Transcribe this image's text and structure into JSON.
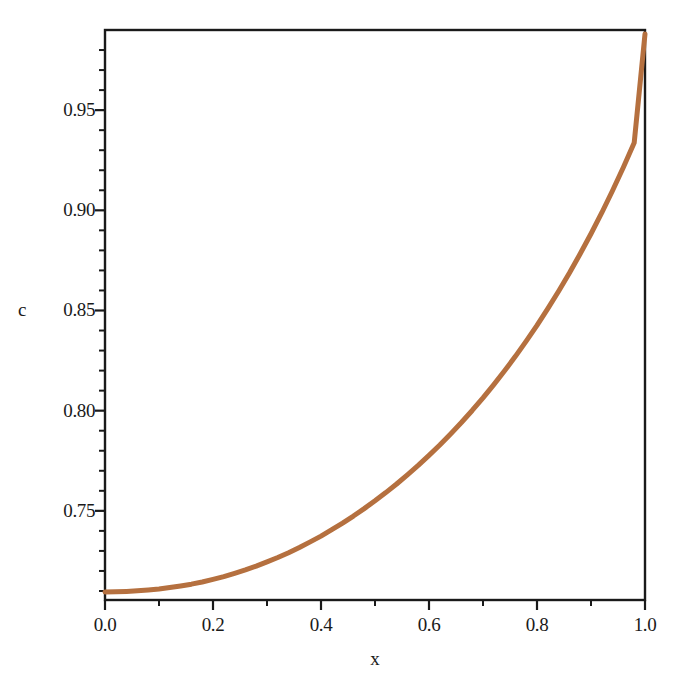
{
  "chart_data": {
    "type": "line",
    "title": "",
    "subtitle": "",
    "xlabel": "x",
    "ylabel": "c",
    "xlim": [
      0.0,
      1.0
    ],
    "ylim": [
      0.7055,
      0.99
    ],
    "grid": false,
    "legend": null,
    "legend_position": "none",
    "line_color": "#b5703f",
    "line_width": 5,
    "axis_color": "#1a1a1a",
    "background": "#ffffff",
    "frame": "full-box",
    "tick_direction": "out",
    "xticks": [
      0.0,
      0.2,
      0.4,
      0.6,
      0.8,
      1.0
    ],
    "xtick_labels": [
      "0.0",
      "0.2",
      "0.4",
      "0.6",
      "0.8",
      "1.0"
    ],
    "x_minor_ticks": [
      0.1,
      0.3,
      0.5,
      0.7,
      0.9
    ],
    "yticks": [
      0.75,
      0.8,
      0.85,
      0.9,
      0.95
    ],
    "ytick_labels": [
      "0.75",
      "0.80",
      "0.85",
      "0.90",
      "0.95"
    ],
    "y_minor_ticks": [
      0.71,
      0.72,
      0.73,
      0.74,
      0.76,
      0.77,
      0.78,
      0.79,
      0.81,
      0.82,
      0.83,
      0.84,
      0.86,
      0.87,
      0.88,
      0.89,
      0.91,
      0.92,
      0.93,
      0.94,
      0.96,
      0.97,
      0.98
    ],
    "series": [
      {
        "name": "c(x)",
        "x": [
          0.0,
          0.02,
          0.04,
          0.06,
          0.08,
          0.1,
          0.12,
          0.14,
          0.16,
          0.18,
          0.2,
          0.22,
          0.24,
          0.26,
          0.28,
          0.3,
          0.32,
          0.34,
          0.36,
          0.38,
          0.4,
          0.42,
          0.44,
          0.46,
          0.48,
          0.5,
          0.52,
          0.54,
          0.56,
          0.58,
          0.6,
          0.62,
          0.64,
          0.66,
          0.68,
          0.7,
          0.72,
          0.74,
          0.76,
          0.78,
          0.8,
          0.82,
          0.84,
          0.86,
          0.88,
          0.9,
          0.92,
          0.94,
          0.96,
          0.98,
          1.0
        ],
        "y": [
          0.7095,
          0.7096,
          0.7098,
          0.7101,
          0.7105,
          0.711,
          0.7117,
          0.7125,
          0.7134,
          0.7145,
          0.7158,
          0.7172,
          0.7188,
          0.7205,
          0.7224,
          0.7245,
          0.7267,
          0.7291,
          0.7317,
          0.7345,
          0.7374,
          0.7406,
          0.7439,
          0.7474,
          0.7511,
          0.755,
          0.7591,
          0.7634,
          0.768,
          0.7727,
          0.7777,
          0.7829,
          0.7884,
          0.7941,
          0.8001,
          0.8064,
          0.813,
          0.8199,
          0.8271,
          0.8347,
          0.8426,
          0.8509,
          0.8596,
          0.8687,
          0.8783,
          0.8883,
          0.8988,
          0.9099,
          0.9215,
          0.9337,
          0.988
        ]
      }
    ],
    "annotations": []
  },
  "axes": {
    "y_title": "c",
    "x_title": "x"
  }
}
